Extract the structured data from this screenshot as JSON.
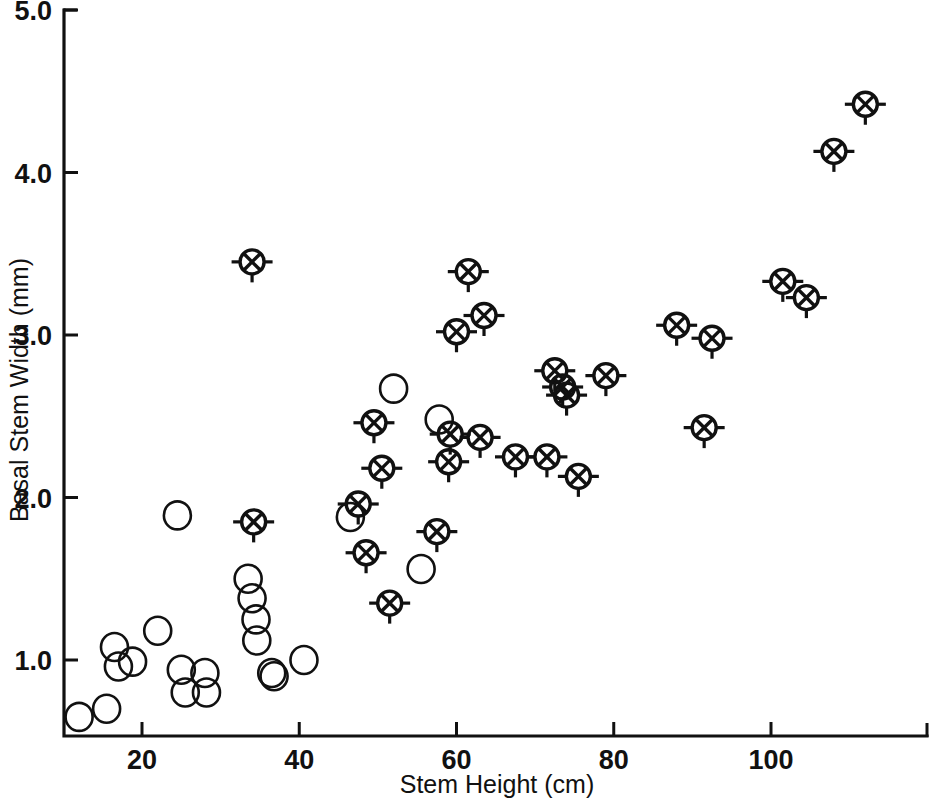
{
  "chart_data": {
    "type": "scatter",
    "title": "",
    "xlabel": "Stem Height (cm)",
    "ylabel": "Basal Stem Width (mm)",
    "xlim": [
      10,
      116
    ],
    "ylim": [
      0.52,
      5.0
    ],
    "xticks": [
      20,
      40,
      60,
      80,
      100
    ],
    "xticklabels": [
      "20",
      "40",
      "60",
      "80",
      "100"
    ],
    "yticks": [
      1.0,
      2.0,
      3.0,
      4.0,
      5.0
    ],
    "yticklabels": [
      "1.0",
      "2.0",
      "3.0",
      "4.0",
      "5.0"
    ],
    "grid": false,
    "legend": "none",
    "series": [
      {
        "name": "open-circle",
        "marker": "open circle",
        "points": [
          [
            12.0,
            0.65
          ],
          [
            15.5,
            0.7
          ],
          [
            16.5,
            1.08
          ],
          [
            17.0,
            0.96
          ],
          [
            18.8,
            0.99
          ],
          [
            22.0,
            1.18
          ],
          [
            24.5,
            1.89
          ],
          [
            25.0,
            0.94
          ],
          [
            25.5,
            0.8
          ],
          [
            28.0,
            0.92
          ],
          [
            28.2,
            0.8
          ],
          [
            33.5,
            1.5
          ],
          [
            34.0,
            1.38
          ],
          [
            34.5,
            1.25
          ],
          [
            34.6,
            1.12
          ],
          [
            36.5,
            0.92
          ],
          [
            36.8,
            0.9
          ],
          [
            40.6,
            1.0
          ],
          [
            46.5,
            1.88
          ],
          [
            52.0,
            2.67
          ],
          [
            55.5,
            1.56
          ],
          [
            57.8,
            2.48
          ]
        ]
      },
      {
        "name": "crossed-circle",
        "marker": "circle with X and stubs",
        "points": [
          [
            34.0,
            3.45
          ],
          [
            34.2,
            1.85
          ],
          [
            47.5,
            1.96
          ],
          [
            48.5,
            1.66
          ],
          [
            49.5,
            2.46
          ],
          [
            50.5,
            2.18
          ],
          [
            51.5,
            1.35
          ],
          [
            57.5,
            1.79
          ],
          [
            59.0,
            2.22
          ],
          [
            59.2,
            2.39
          ],
          [
            60.0,
            3.02
          ],
          [
            61.5,
            3.39
          ],
          [
            63.0,
            2.37
          ],
          [
            63.5,
            3.12
          ],
          [
            67.5,
            2.25
          ],
          [
            71.5,
            2.25
          ],
          [
            72.5,
            2.78
          ],
          [
            73.5,
            2.68
          ],
          [
            74.0,
            2.63
          ],
          [
            75.5,
            2.13
          ],
          [
            79.0,
            2.75
          ],
          [
            88.0,
            3.06
          ],
          [
            91.5,
            2.43
          ],
          [
            92.5,
            2.98
          ],
          [
            101.5,
            3.33
          ],
          [
            104.5,
            3.23
          ],
          [
            108.0,
            4.13
          ],
          [
            112.0,
            4.42
          ]
        ]
      }
    ]
  }
}
